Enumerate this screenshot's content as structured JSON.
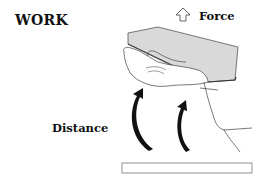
{
  "diagram": {
    "title": "WORK",
    "labels": {
      "force": "Force",
      "distance": "Distance"
    },
    "icons": {
      "force_arrow": "outline-up-arrow",
      "motion_arrows": "curved-up-arrows"
    },
    "colors": {
      "ink": "#111111",
      "book_fill": "#d8d8d8",
      "line": "#555555",
      "background": "#ffffff"
    }
  }
}
